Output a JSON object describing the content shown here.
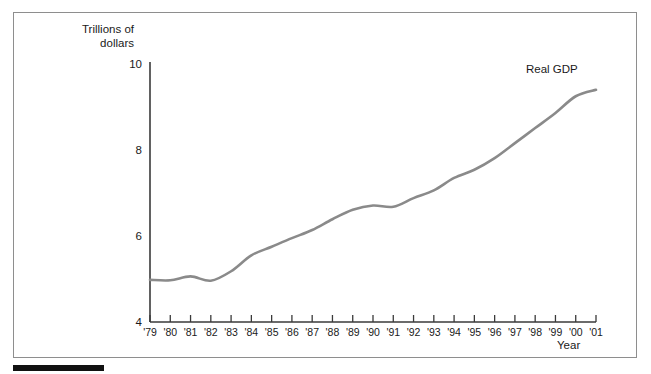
{
  "figure": {
    "background_color": "#ffffff",
    "frame_border_color": "#8e8e8e",
    "footer_rule_color": "#111111"
  },
  "chart_data": {
    "type": "line",
    "title": "",
    "subtitle": "",
    "xlabel": "Year",
    "ylabel": "Trillions of\ndollars",
    "ylabel_line1": "Trillions of",
    "ylabel_line2": "dollars",
    "series_label": "Real GDP",
    "line_color": "#8a8a8a",
    "grid": false,
    "legend_position": "inline-annotation-top-right",
    "xlim": [
      1979,
      2001
    ],
    "ylim": [
      4,
      10
    ],
    "ytick_values": [
      4,
      6,
      8,
      10
    ],
    "ytick_labels": [
      "4",
      "6",
      "8",
      "10"
    ],
    "categories": [
      "'79",
      "'80",
      "'81",
      "'82",
      "'83",
      "'84",
      "'85",
      "'86",
      "'87",
      "'88",
      "'89",
      "'90",
      "'91",
      "'92",
      "'93",
      "'94",
      "'95",
      "'96",
      "'97",
      "'98",
      "'99",
      "'00",
      "'01"
    ],
    "x": [
      1979,
      1980,
      1981,
      1982,
      1983,
      1984,
      1985,
      1986,
      1987,
      1988,
      1989,
      1990,
      1991,
      1992,
      1993,
      1994,
      1995,
      1996,
      1997,
      1998,
      1999,
      2000,
      2001
    ],
    "series": [
      {
        "name": "Real GDP",
        "values": [
          4.98,
          4.97,
          5.06,
          4.96,
          5.18,
          5.55,
          5.75,
          5.95,
          6.14,
          6.39,
          6.61,
          6.71,
          6.68,
          6.88,
          7.06,
          7.35,
          7.54,
          7.81,
          8.16,
          8.51,
          8.86,
          9.25,
          9.4
        ]
      }
    ],
    "annotations": [
      {
        "text": "Real GDP",
        "x": 2000,
        "y": 9.85
      }
    ]
  }
}
